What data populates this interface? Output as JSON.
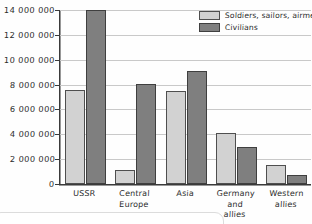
{
  "chart_data": {
    "type": "bar",
    "title": "",
    "xlabel": "",
    "ylabel": "",
    "ylim": [
      0,
      14000000
    ],
    "ytick_step": 2000000,
    "grid": true,
    "legend_position": "top-right",
    "categories": [
      "USSR",
      "Central\nEurope",
      "Asia",
      "Germany\nand\nallies",
      "Western\nallies"
    ],
    "ytick_labels": [
      "14 000 000",
      "12 000 000",
      "10 000 000",
      "8 000 000",
      "6 000 000",
      "4 000 000",
      "2 000 000",
      "0"
    ],
    "ytick_values": [
      14000000,
      12000000,
      10000000,
      8000000,
      6000000,
      4000000,
      2000000,
      0
    ],
    "series": [
      {
        "name": "Soldiers, sailors, airmen",
        "color": "#d2d2d2",
        "values": [
          7600000,
          1100000,
          7500000,
          4100000,
          1500000
        ]
      },
      {
        "name": "Civilians",
        "color": "#7f7f7f",
        "values": [
          14000000,
          8050000,
          9100000,
          3000000,
          700000
        ]
      }
    ]
  },
  "legend": {
    "items": [
      {
        "label": "Soldiers, sailors, airmen",
        "swatch": "mil"
      },
      {
        "label": "Civilians",
        "swatch": "civ"
      }
    ]
  },
  "colors": {
    "military": "#d2d2d2",
    "civilian": "#7f7f7f",
    "axis": "#3a3a3a",
    "grid": "#c9c9c9",
    "background": "#fefefe"
  }
}
